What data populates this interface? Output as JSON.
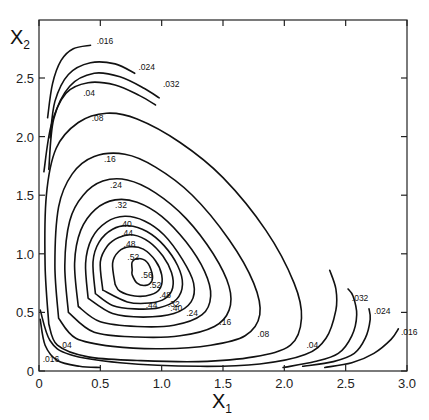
{
  "chart_data": {
    "type": "contour",
    "title": "",
    "xlabel": "X",
    "xlabel_sub": "1",
    "ylabel": "X",
    "ylabel_sub": "2",
    "xlim": [
      0,
      3.0
    ],
    "ylim": [
      0,
      2.75
    ],
    "grid": false,
    "x_ticks": [
      0,
      0.5,
      1.0,
      1.5,
      2.0,
      2.5,
      3.0
    ],
    "x_tick_labels": [
      "0",
      "0.5",
      "1.0",
      "1.5",
      "2.0",
      "2.5",
      "3.0"
    ],
    "y_ticks": [
      0,
      0.5,
      1.0,
      1.5,
      2.0,
      2.5
    ],
    "y_tick_labels": [
      "0",
      "0.5",
      "1.0",
      "1.5",
      "2.0",
      "2.5"
    ],
    "contours": [
      {
        "level": ".016",
        "segments": [
          [
            [
              0.07,
              2.16
            ],
            [
              0.11,
              2.45
            ],
            [
              0.18,
              2.65
            ],
            [
              0.28,
              2.75
            ],
            [
              0.42,
              2.78
            ]
          ],
          [
            [
              0.01,
              0.44
            ],
            [
              0.05,
              0.22
            ],
            [
              0.15,
              0.09
            ],
            [
              0.33,
              0.04
            ],
            [
              0.5,
              0.03
            ]
          ],
          [
            [
              2.33,
              0.03
            ],
            [
              2.55,
              0.07
            ],
            [
              2.73,
              0.15
            ],
            [
              2.87,
              0.27
            ],
            [
              2.93,
              0.36
            ]
          ]
        ],
        "labels": [
          [
            0.47,
            2.79
          ],
          [
            0.03,
            0.08
          ],
          [
            2.95,
            0.31
          ]
        ]
      },
      {
        "level": ".024",
        "segments": [
          [
            [
              0.09,
              1.99
            ],
            [
              0.13,
              2.3
            ],
            [
              0.24,
              2.53
            ],
            [
              0.42,
              2.63
            ],
            [
              0.62,
              2.62
            ],
            [
              0.78,
              2.54
            ]
          ],
          [
            [
              2.15,
              0.04
            ],
            [
              2.4,
              0.08
            ],
            [
              2.57,
              0.15
            ],
            [
              2.66,
              0.28
            ],
            [
              2.7,
              0.44
            ],
            [
              2.69,
              0.53
            ]
          ]
        ],
        "labels": [
          [
            0.81,
            2.57
          ],
          [
            2.73,
            0.49
          ]
        ]
      },
      {
        "level": ".032",
        "segments": [
          [
            [
              0.08,
              1.72
            ],
            [
              0.12,
              2.15
            ],
            [
              0.25,
              2.43
            ],
            [
              0.45,
              2.54
            ],
            [
              0.66,
              2.51
            ],
            [
              0.86,
              2.41
            ],
            [
              0.98,
              2.33
            ]
          ],
          [
            [
              1.99,
              0.03
            ],
            [
              2.25,
              0.08
            ],
            [
              2.44,
              0.15
            ],
            [
              2.55,
              0.3
            ],
            [
              2.59,
              0.48
            ],
            [
              2.56,
              0.64
            ],
            [
              2.52,
              0.7
            ]
          ]
        ],
        "labels": [
          [
            1.01,
            2.42
          ],
          [
            2.55,
            0.6
          ]
        ]
      },
      {
        "level": ".04",
        "segments": [
          [
            [
              0.04,
              1.7
            ],
            [
              0.1,
              2.1
            ],
            [
              0.22,
              2.37
            ],
            [
              0.4,
              2.46
            ],
            [
              0.62,
              2.44
            ],
            [
              0.82,
              2.35
            ],
            [
              0.95,
              2.27
            ]
          ],
          [
            [
              0.01,
              0.52
            ],
            [
              0.09,
              0.26
            ],
            [
              0.25,
              0.14
            ],
            [
              0.66,
              0.07
            ],
            [
              1.31,
              0.04
            ],
            [
              1.8,
              0.06
            ],
            [
              2.17,
              0.14
            ],
            [
              2.34,
              0.28
            ],
            [
              2.42,
              0.52
            ],
            [
              2.42,
              0.7
            ],
            [
              2.37,
              0.86
            ]
          ]
        ],
        "labels": [
          [
            0.36,
            2.35
          ],
          [
            0.17,
            0.2
          ],
          [
            2.18,
            0.2
          ]
        ]
      },
      {
        "level": ".08",
        "closed": false,
        "segments": [
          [
            [
              0.08,
              0.4
            ],
            [
              0.05,
              0.9
            ],
            [
              0.06,
              1.5
            ],
            [
              0.14,
              1.9
            ],
            [
              0.32,
              2.12
            ],
            [
              0.55,
              2.2
            ],
            [
              0.8,
              2.15
            ],
            [
              1.15,
              1.95
            ],
            [
              1.5,
              1.65
            ],
            [
              1.85,
              1.2
            ],
            [
              2.08,
              0.75
            ],
            [
              2.14,
              0.45
            ],
            [
              2.05,
              0.22
            ],
            [
              1.75,
              0.12
            ],
            [
              1.3,
              0.08
            ],
            [
              0.8,
              0.09
            ],
            [
              0.4,
              0.12
            ],
            [
              0.15,
              0.22
            ],
            [
              0.08,
              0.4
            ]
          ]
        ],
        "labels": [
          [
            0.43,
            2.13
          ],
          [
            1.78,
            0.29
          ]
        ]
      },
      {
        "level": ".16",
        "segments": [
          [
            [
              0.16,
              0.45
            ],
            [
              0.13,
              0.9
            ],
            [
              0.16,
              1.4
            ],
            [
              0.27,
              1.68
            ],
            [
              0.45,
              1.83
            ],
            [
              0.7,
              1.85
            ],
            [
              0.95,
              1.74
            ],
            [
              1.25,
              1.5
            ],
            [
              1.55,
              1.12
            ],
            [
              1.75,
              0.75
            ],
            [
              1.8,
              0.48
            ],
            [
              1.68,
              0.3
            ],
            [
              1.4,
              0.22
            ],
            [
              1.0,
              0.19
            ],
            [
              0.6,
              0.21
            ],
            [
              0.3,
              0.28
            ],
            [
              0.16,
              0.45
            ]
          ]
        ],
        "labels": [
          [
            0.53,
            1.78
          ],
          [
            1.47,
            0.39
          ]
        ]
      },
      {
        "level": ".24",
        "segments": [
          [
            [
              0.24,
              0.5
            ],
            [
              0.21,
              0.9
            ],
            [
              0.25,
              1.28
            ],
            [
              0.36,
              1.5
            ],
            [
              0.52,
              1.62
            ],
            [
              0.72,
              1.63
            ],
            [
              0.95,
              1.52
            ],
            [
              1.2,
              1.3
            ],
            [
              1.42,
              1.0
            ],
            [
              1.55,
              0.72
            ],
            [
              1.55,
              0.52
            ],
            [
              1.43,
              0.38
            ],
            [
              1.15,
              0.3
            ],
            [
              0.8,
              0.29
            ],
            [
              0.45,
              0.33
            ],
            [
              0.24,
              0.5
            ]
          ]
        ],
        "labels": [
          [
            0.58,
            1.56
          ],
          [
            1.2,
            0.47
          ]
        ]
      },
      {
        "level": ".32",
        "segments": [
          [
            [
              0.32,
              0.55
            ],
            [
              0.29,
              0.92
            ],
            [
              0.34,
              1.2
            ],
            [
              0.46,
              1.38
            ],
            [
              0.62,
              1.46
            ],
            [
              0.8,
              1.44
            ],
            [
              1.0,
              1.32
            ],
            [
              1.2,
              1.1
            ],
            [
              1.35,
              0.85
            ],
            [
              1.4,
              0.64
            ],
            [
              1.33,
              0.48
            ],
            [
              1.1,
              0.39
            ],
            [
              0.8,
              0.38
            ],
            [
              0.5,
              0.42
            ],
            [
              0.32,
              0.55
            ]
          ]
        ],
        "labels": [
          [
            0.62,
            1.39
          ],
          [
            1.05,
            0.55
          ]
        ]
      },
      {
        "level": ".40",
        "segments": [
          [
            [
              0.4,
              0.62
            ],
            [
              0.38,
              0.92
            ],
            [
              0.43,
              1.13
            ],
            [
              0.55,
              1.27
            ],
            [
              0.7,
              1.32
            ],
            [
              0.86,
              1.28
            ],
            [
              1.02,
              1.16
            ],
            [
              1.17,
              0.95
            ],
            [
              1.26,
              0.75
            ],
            [
              1.24,
              0.59
            ],
            [
              1.1,
              0.49
            ],
            [
              0.85,
              0.46
            ],
            [
              0.6,
              0.49
            ],
            [
              0.4,
              0.62
            ]
          ]
        ],
        "labels": [
          [
            0.66,
            1.23
          ],
          [
            1.07,
            0.51
          ]
        ]
      },
      {
        "level": ".44",
        "segments": [
          [
            [
              0.46,
              0.66
            ],
            [
              0.44,
              0.93
            ],
            [
              0.49,
              1.1
            ],
            [
              0.6,
              1.21
            ],
            [
              0.73,
              1.24
            ],
            [
              0.88,
              1.19
            ],
            [
              1.02,
              1.07
            ],
            [
              1.13,
              0.9
            ],
            [
              1.17,
              0.74
            ],
            [
              1.12,
              0.61
            ],
            [
              0.98,
              0.54
            ],
            [
              0.78,
              0.53
            ],
            [
              0.6,
              0.56
            ],
            [
              0.46,
              0.66
            ]
          ]
        ],
        "labels": [
          [
            0.67,
            1.15
          ],
          [
            0.87,
            0.54
          ]
        ]
      },
      {
        "level": ".48",
        "segments": [
          [
            [
              0.52,
              0.69
            ],
            [
              0.5,
              0.93
            ],
            [
              0.56,
              1.07
            ],
            [
              0.65,
              1.14
            ],
            [
              0.77,
              1.16
            ],
            [
              0.9,
              1.1
            ],
            [
              1.01,
              0.98
            ],
            [
              1.08,
              0.84
            ],
            [
              1.09,
              0.71
            ],
            [
              1.03,
              0.62
            ],
            [
              0.9,
              0.58
            ],
            [
              0.72,
              0.59
            ],
            [
              0.52,
              0.69
            ]
          ]
        ],
        "labels": [
          [
            0.69,
            1.06
          ],
          [
            0.98,
            0.62
          ]
        ]
      },
      {
        "level": ".52",
        "segments": [
          [
            [
              0.62,
              0.74
            ],
            [
              0.6,
              0.92
            ],
            [
              0.65,
              1.02
            ],
            [
              0.74,
              1.06
            ],
            [
              0.85,
              1.04
            ],
            [
              0.95,
              0.94
            ],
            [
              1.0,
              0.82
            ],
            [
              0.99,
              0.71
            ],
            [
              0.91,
              0.65
            ],
            [
              0.78,
              0.64
            ],
            [
              0.66,
              0.68
            ],
            [
              0.62,
              0.74
            ]
          ]
        ],
        "labels": [
          [
            0.72,
            0.95
          ],
          [
            0.9,
            0.71
          ]
        ]
      },
      {
        "level": ".56",
        "segments": [
          [
            [
              0.76,
              0.86
            ],
            [
              0.76,
              0.93
            ],
            [
              0.81,
              0.96
            ],
            [
              0.88,
              0.93
            ],
            [
              0.92,
              0.84
            ],
            [
              0.92,
              0.77
            ],
            [
              0.87,
              0.73
            ],
            [
              0.8,
              0.75
            ],
            [
              0.76,
              0.82
            ],
            [
              0.76,
              0.86
            ]
          ]
        ],
        "labels": [
          [
            0.83,
            0.79
          ]
        ]
      }
    ]
  }
}
